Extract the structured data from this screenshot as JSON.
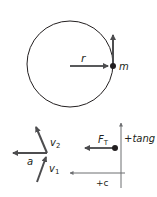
{
  "diagram": {
    "top": {
      "name": "circular-motion",
      "radius_label": "r",
      "mass_label": "m"
    },
    "bottom_left": {
      "name": "velocity-vector-difference",
      "accel_label": "a",
      "v2_label": "v",
      "v2_sub": "2",
      "v1_label": "v",
      "v1_sub": "1"
    },
    "bottom_right": {
      "name": "free-body-diagram",
      "force_label": "F",
      "force_sub": "T",
      "tang_axis_label": "+tang",
      "c_axis_label": "+c"
    },
    "colors": {
      "line": "#231f20",
      "arrow": "#58595b",
      "axis": "#6d6e71"
    }
  }
}
